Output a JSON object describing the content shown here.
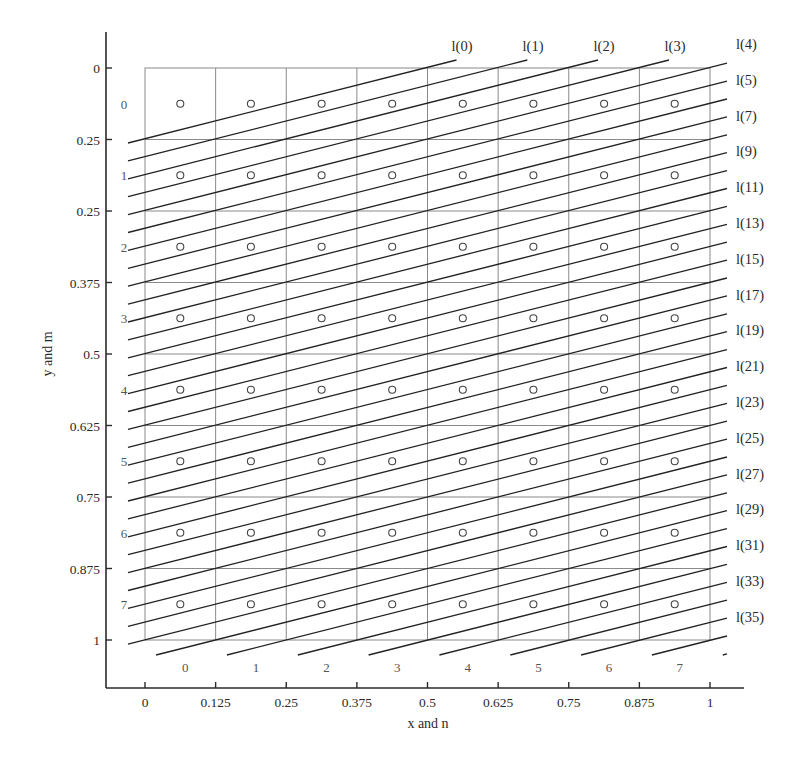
{
  "chart_data": {
    "type": "diagram",
    "title": "",
    "xlabel": "x and n",
    "ylabel": "y and m",
    "x_ticks": [
      "0",
      "0.125",
      "0.25",
      "0.375",
      "0.5",
      "0.625",
      "0.75",
      "0.875",
      "1"
    ],
    "y_ticks": [
      "0",
      "0.25",
      "0.25",
      "0.375",
      "0.5",
      "0.625",
      "0.75",
      "0.875",
      "1"
    ],
    "grid": {
      "columns": 8,
      "rows": 8,
      "column_labels": [
        "0",
        "1",
        "2",
        "3",
        "4",
        "5",
        "6",
        "7"
      ],
      "row_labels": [
        "0",
        "1",
        "2",
        "3",
        "4",
        "5",
        "6",
        "7"
      ]
    },
    "sample_points": "circle at center of each of the 8x8 cells (64 points)",
    "line_family": {
      "description": "parallel sampling lines with slope ~1/4 (rising to the right), spaced 1/4 row apart vertically",
      "top_labels": [
        "l(0)",
        "l(1)",
        "l(2)",
        "l(3)"
      ],
      "right_labels": [
        "l(4)",
        "l(5)",
        "l(7)",
        "l(9)",
        "l(11)",
        "l(13)",
        "l(15)",
        "l(17)",
        "l(19)",
        "l(21)",
        "l(23)",
        "l(25)",
        "l(27)",
        "l(29)",
        "l(31)",
        "l(33)",
        "l(35)"
      ]
    },
    "legend": null
  },
  "colors": {
    "axis": "#2a2a2a",
    "grid": "#8a8a8a",
    "lines": "#222222",
    "points": "#444444"
  },
  "geometry": {
    "box_left": 145,
    "box_top": 68,
    "box_right": 710,
    "box_bottom": 640,
    "axis_x": 106,
    "axis_y": 688,
    "axis_top": 32,
    "axis_right": 744,
    "line_x_min": 128,
    "line_x_max": 727,
    "line_y_min": 60,
    "line_y_max": 655,
    "line_first_left_y": 143,
    "line_spacing": 17.9,
    "line_slope": 0.2527,
    "line_count": 41
  }
}
